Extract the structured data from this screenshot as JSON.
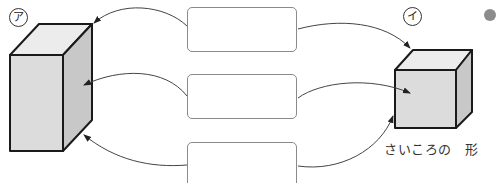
{
  "figure": {
    "left_shape": {
      "marker": "ア",
      "kind": "rectangular-prism"
    },
    "right_shape": {
      "marker": "イ",
      "kind": "cube",
      "caption": "さいころの　形"
    },
    "answer_boxes": [
      {
        "id": "top",
        "value": ""
      },
      {
        "id": "middle",
        "value": ""
      },
      {
        "id": "bottom",
        "value": ""
      }
    ],
    "arrows": [
      {
        "from": "top-box",
        "to_left": "vertex",
        "to_right": "vertex"
      },
      {
        "from": "middle-box",
        "to_left": "face",
        "to_right": "face"
      },
      {
        "from": "bottom-box",
        "to_left": "edge",
        "to_right": "edge"
      }
    ],
    "colors": {
      "face_front": "#dcdcdc",
      "face_top": "#ececec",
      "face_side": "#c4c4c4",
      "outline": "#1a1a1a",
      "arrow": "#444444",
      "dot": "#8c8c8c"
    }
  }
}
